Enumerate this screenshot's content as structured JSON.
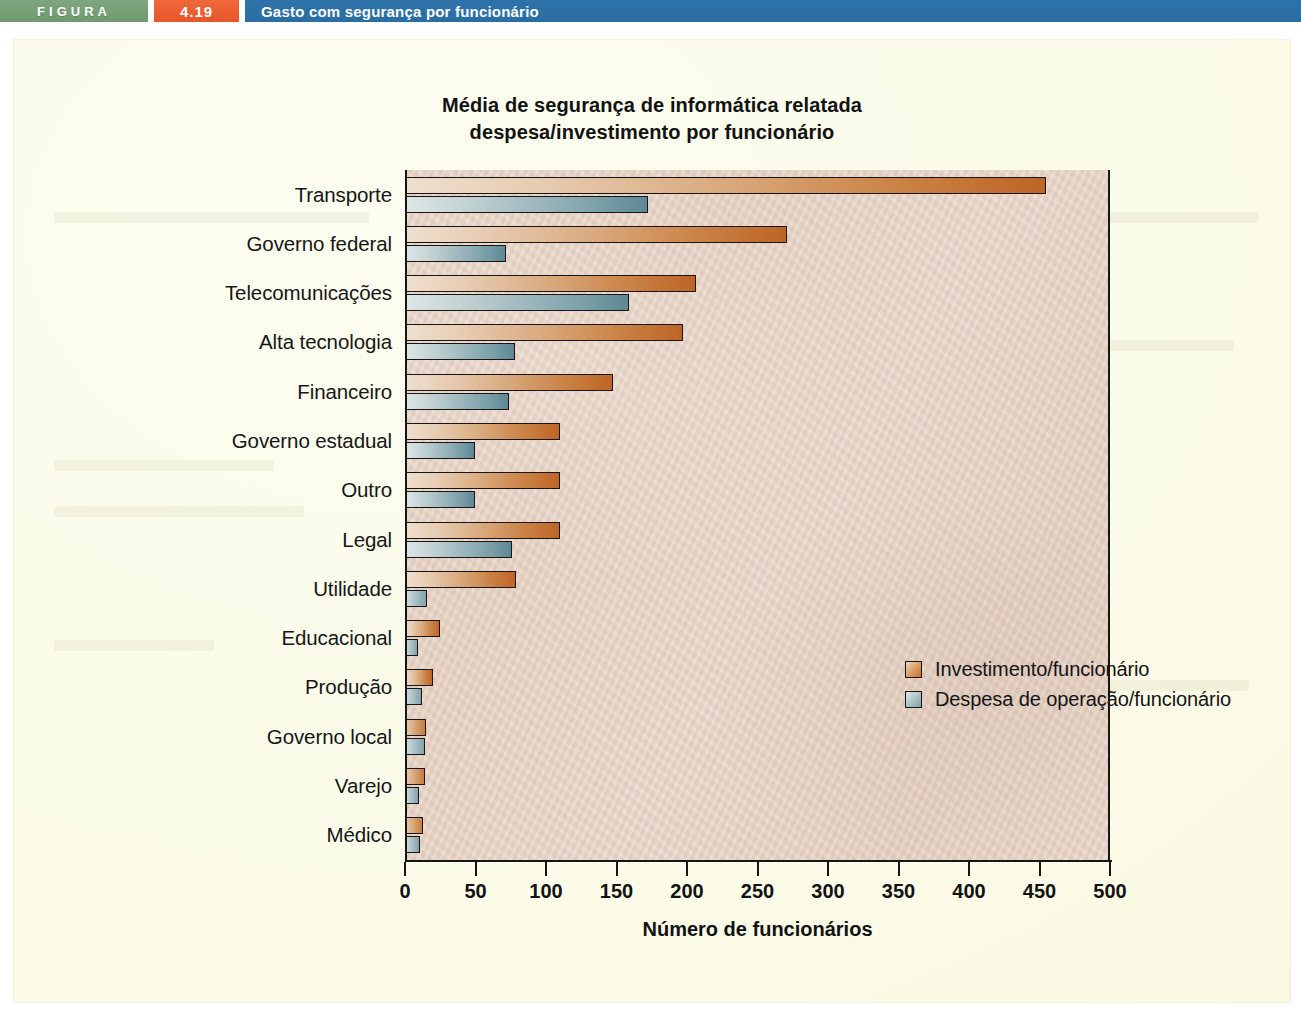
{
  "banner": {
    "figura_label": "FIGURA",
    "figure_number": "4.19",
    "caption": "Gasto com segurança por funcionário",
    "colors": {
      "figura_green": "#6e9a70",
      "number_orange": "#e8552a",
      "caption_blue": "#2a6da2"
    }
  },
  "chart_data": {
    "type": "bar",
    "orientation": "horizontal",
    "title": "Média de segurança de informática relatada\ndespesa/investimento por funcionário",
    "title_line1": "Média de segurança de informática relatada",
    "title_line2": "despesa/investimento por funcionário",
    "xlabel": "Número de funcionários",
    "ylabel": "",
    "xlim": [
      0,
      500
    ],
    "xticks": [
      0,
      50,
      100,
      150,
      200,
      250,
      300,
      350,
      400,
      450,
      500
    ],
    "xtick_labels": [
      "0",
      "50",
      "100",
      "150",
      "200",
      "250",
      "300",
      "350",
      "400",
      "450",
      "500"
    ],
    "grid": false,
    "legend_position": "center-right-inside",
    "categories": [
      "Transporte",
      "Governo federal",
      "Telecomunicações",
      "Alta tecnologia",
      "Financeiro",
      "Governo estadual",
      "Outro",
      "Legal",
      "Utilidade",
      "Educacional",
      "Produção",
      "Governo local",
      "Varejo",
      "Médico"
    ],
    "series": [
      {
        "name": "Investimento/funcionário",
        "color": "#c4702f",
        "values": [
          456,
          272,
          207,
          198,
          148,
          110,
          110,
          110,
          79,
          25,
          20,
          15,
          14,
          13
        ]
      },
      {
        "name": "Despesa de operação/funcionário",
        "color": "#7fa0a9",
        "values": [
          173,
          72,
          159,
          78,
          74,
          50,
          50,
          76,
          16,
          9,
          12,
          14,
          10,
          11
        ]
      }
    ]
  }
}
